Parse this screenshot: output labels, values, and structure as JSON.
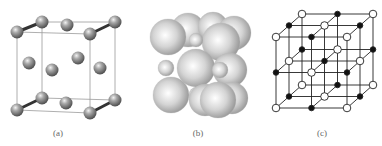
{
  "figure": {
    "panels": [
      {
        "id": "a",
        "label": "(a)",
        "description": "Unit cell wireframe with atoms at corners, face centers, and pairs bonded along edges",
        "atom_color": "#8a8a8a"
      },
      {
        "id": "b",
        "label": "(b)",
        "description": "Space-filling model with large and small spheres",
        "sphere_color": "#c8c8c8"
      },
      {
        "id": "c",
        "label": "(c)",
        "description": "3x3x3 lattice with alternating open and filled nodes",
        "open_node_color": "#ffffff",
        "filled_node_color": "#111111",
        "line_color": "#222222"
      }
    ]
  }
}
